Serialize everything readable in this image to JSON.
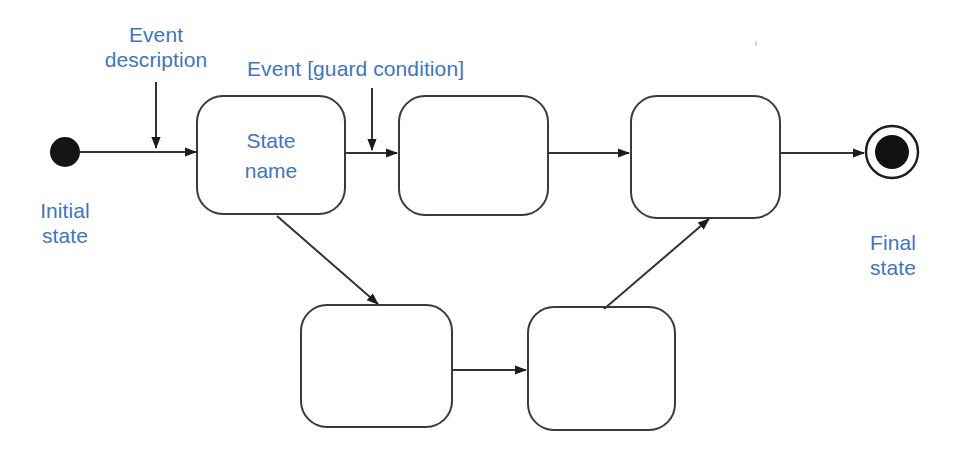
{
  "diagram": {
    "type": "uml-state-machine-diagram",
    "background_color": "#ffffff",
    "stroke_color": "#2b2b2b",
    "label_color": "#3f75c0",
    "annotations": [
      {
        "id": "event-description",
        "text_line1": "Event",
        "text_line2": "description",
        "x": 104,
        "y": 22,
        "width": 108
      },
      {
        "id": "event-guard-condition",
        "text": "Event [guard condition]",
        "x": 247,
        "y": 56
      },
      {
        "id": "initial-state-label",
        "text_line1": "Initial",
        "text_line2": "state",
        "x": 32,
        "y": 198,
        "width": 66
      },
      {
        "id": "final-state-label",
        "text_line1": "Final",
        "text_line2": "state",
        "x": 861,
        "y": 230,
        "width": 64
      }
    ],
    "nodes": [
      {
        "id": "initial-state",
        "kind": "initial-pseudostate",
        "cx": 65,
        "cy": 152,
        "r": 15,
        "label": ""
      },
      {
        "id": "state-1",
        "kind": "state",
        "label": "State\nname",
        "x": 197,
        "y": 96,
        "width": 148,
        "height": 118,
        "rx": 26
      },
      {
        "id": "state-2",
        "kind": "state",
        "label": "",
        "x": 399,
        "y": 96,
        "width": 149,
        "height": 119,
        "rx": 26
      },
      {
        "id": "state-3",
        "kind": "state",
        "label": "",
        "x": 631,
        "y": 96,
        "width": 149,
        "height": 122,
        "rx": 26
      },
      {
        "id": "state-4",
        "kind": "state",
        "label": "",
        "x": 301,
        "y": 305,
        "width": 151,
        "height": 122,
        "rx": 26
      },
      {
        "id": "state-5",
        "kind": "state",
        "label": "",
        "x": 528,
        "y": 307,
        "width": 147,
        "height": 123,
        "rx": 26
      },
      {
        "id": "final-state",
        "kind": "final-state",
        "cx": 892,
        "cy": 152,
        "outer_r": 26,
        "inner_r": 17,
        "label": ""
      }
    ],
    "transitions": [
      {
        "id": "t-initial-to-state1",
        "from": "initial-state",
        "to": "state-1",
        "points": "80,152 196,152",
        "arrowhead": true
      },
      {
        "id": "t-state1-to-state2",
        "from": "state-1",
        "to": "state-2",
        "points": "345,153 397,153",
        "arrowhead": true
      },
      {
        "id": "t-state2-to-state3",
        "from": "state-2",
        "to": "state-3",
        "points": "548,153 629,153",
        "arrowhead": true
      },
      {
        "id": "t-state3-to-final",
        "from": "state-3",
        "to": "final-state",
        "points": "781,153 864,153",
        "arrowhead": true
      },
      {
        "id": "t-state1-to-state4",
        "from": "state-1",
        "to": "state-4",
        "points": "277,216 378,304",
        "arrowhead": true
      },
      {
        "id": "t-state4-to-state5",
        "from": "state-4",
        "to": "state-5",
        "points": "452,370 526,370",
        "arrowhead": true
      },
      {
        "id": "t-state5-to-state3",
        "from": "state-5",
        "to": "state-3",
        "points": "604,309 709,219",
        "arrowhead": true
      }
    ],
    "callouts": [
      {
        "id": "callout-event-description",
        "label_ref": "event-description",
        "points": "156,82 156,148",
        "arrowhead": true
      },
      {
        "id": "callout-event-guard",
        "label_ref": "event-guard-condition",
        "points": "372,88 372,150",
        "arrowhead": true
      }
    ]
  }
}
